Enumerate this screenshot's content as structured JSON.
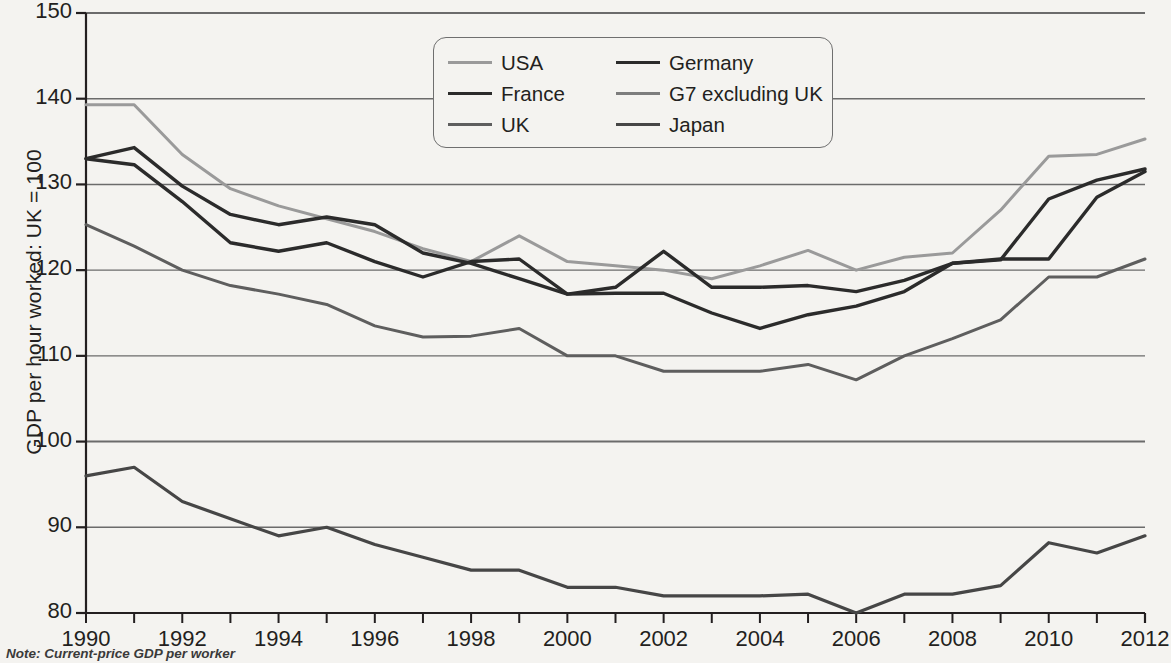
{
  "chart_data": {
    "type": "line",
    "title": "",
    "xlabel": "",
    "ylabel": "GDP per hour worked: UK = 100",
    "xlim": [
      1990,
      2012
    ],
    "ylim": [
      80,
      150
    ],
    "yticks": [
      80,
      90,
      100,
      110,
      120,
      130,
      140,
      150
    ],
    "xticks": [
      1990,
      1992,
      1994,
      1996,
      1998,
      2000,
      2002,
      2004,
      2006,
      2008,
      2010,
      2012
    ],
    "xtick_all_years": [
      1990,
      1991,
      1992,
      1993,
      1994,
      1995,
      1996,
      1997,
      1998,
      1999,
      2000,
      2001,
      2002,
      2003,
      2004,
      2005,
      2006,
      2007,
      2008,
      2009,
      2010,
      2011,
      2012
    ],
    "grid": true,
    "grid_axis": "y",
    "legend_position": "top-center",
    "note": "Note: Current-price GDP per worker",
    "x": [
      1990,
      1991,
      1992,
      1993,
      1994,
      1995,
      1996,
      1997,
      1998,
      1999,
      2000,
      2001,
      2002,
      2003,
      2004,
      2005,
      2006,
      2007,
      2008,
      2009,
      2010,
      2011,
      2012
    ],
    "series": [
      {
        "name": "USA",
        "color": "#9a9a9a",
        "width": 3.0,
        "values": [
          139.3,
          139.3,
          133.5,
          129.5,
          127.5,
          126.0,
          124.5,
          122.5,
          121.0,
          124.0,
          121.0,
          120.5,
          120.0,
          119.0,
          120.5,
          122.3,
          120.0,
          121.5,
          122.0,
          127.0,
          133.3,
          133.5,
          135.3
        ]
      },
      {
        "name": "Germany",
        "color": "#2b2b2b",
        "width": 3.4,
        "values": [
          133.0,
          132.3,
          128.0,
          123.2,
          122.2,
          123.2,
          121.0,
          119.2,
          121.0,
          121.3,
          117.2,
          118.0,
          122.2,
          118.0,
          118.0,
          118.2,
          117.5,
          118.8,
          120.8,
          121.2,
          128.3,
          130.5,
          131.8
        ]
      },
      {
        "name": "France",
        "color": "#2b2b2b",
        "width": 3.4,
        "values": [
          133.0,
          134.3,
          129.8,
          126.5,
          125.3,
          126.2,
          125.3,
          122.0,
          120.8,
          119.0,
          117.2,
          117.3,
          117.3,
          115.0,
          113.2,
          114.8,
          115.8,
          117.5,
          120.8,
          121.3,
          121.3,
          128.5,
          131.5
        ]
      },
      {
        "name": "G7 excluding UK",
        "color": "#5e5e5e",
        "width": 3.0,
        "values": [
          125.3,
          122.8,
          120.0,
          118.2,
          117.2,
          116.0,
          113.5,
          112.2,
          112.3,
          113.2,
          110.0,
          110.0,
          108.2,
          108.2,
          108.2,
          109.0,
          107.2,
          110.0,
          112.0,
          114.2,
          119.2,
          119.2,
          121.3
        ]
      },
      {
        "name": "UK",
        "color": "#5e5e5e",
        "width": 3.0,
        "values": [
          100.0,
          100.0,
          100.0,
          100.0,
          100.0,
          100.0,
          100.0,
          100.0,
          100.0,
          100.0,
          100.0,
          100.0,
          100.0,
          100.0,
          100.0,
          100.0,
          100.0,
          100.0,
          100.0,
          100.0,
          100.0,
          100.0,
          100.0
        ]
      },
      {
        "name": "Japan",
        "color": "#464646",
        "width": 3.2,
        "values": [
          96.0,
          97.0,
          93.0,
          91.0,
          89.0,
          90.0,
          88.0,
          86.5,
          85.0,
          85.0,
          83.0,
          83.0,
          82.0,
          82.0,
          82.0,
          82.2,
          80.0,
          82.2,
          82.2,
          83.2,
          88.2,
          87.0,
          89.0
        ]
      }
    ]
  },
  "legend": {
    "items": [
      {
        "label": "USA",
        "color": "#9a9a9a",
        "width": 3.0
      },
      {
        "label": "Germany",
        "color": "#2b2b2b",
        "width": 3.6
      },
      {
        "label": "France",
        "color": "#2b2b2b",
        "width": 3.6
      },
      {
        "label": "G7 excluding UK",
        "color": "#7d7d7d",
        "width": 3.0
      },
      {
        "label": "UK",
        "color": "#5e5e5e",
        "width": 3.0
      },
      {
        "label": "Japan",
        "color": "#464646",
        "width": 3.4
      }
    ]
  },
  "axes": {
    "y_title": "GDP per hour worked: UK = 100",
    "y_labels": [
      "150",
      "140",
      "130",
      "120",
      "110",
      "100",
      "90",
      "80"
    ],
    "x_labels": [
      "1990",
      "1992",
      "1994",
      "1996",
      "1998",
      "2000",
      "2002",
      "2004",
      "2006",
      "2008",
      "2010",
      "2012"
    ]
  },
  "footer": {
    "note": "Note: Current-price GDP per worker"
  },
  "style": {
    "background": "#f4f3f0",
    "axis_color": "#231f20",
    "grid_color": "#6b6b6b"
  }
}
